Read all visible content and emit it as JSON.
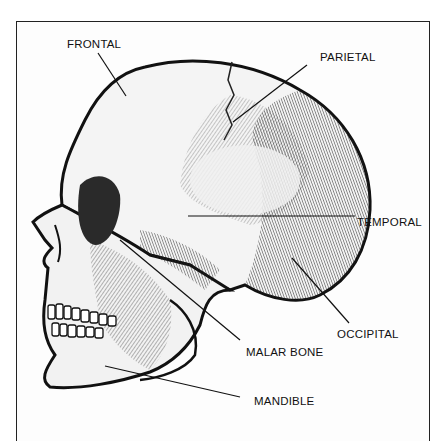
{
  "diagram": {
    "labels": [
      {
        "id": "frontal",
        "text": "FRONTAL",
        "x": 67,
        "y": 38
      },
      {
        "id": "parietal",
        "text": "PARIETAL",
        "x": 320,
        "y": 51
      },
      {
        "id": "temporal",
        "text": "TEMPORAL",
        "x": 357,
        "y": 216
      },
      {
        "id": "occipital",
        "text": "OCCIPITAL",
        "x": 337,
        "y": 328
      },
      {
        "id": "malar",
        "text": "MALAR BONE",
        "x": 246,
        "y": 346
      },
      {
        "id": "mandible",
        "text": "MANDIBLE",
        "x": 254,
        "y": 395
      }
    ],
    "colors": {
      "ink": "#111111",
      "paper": "#fdfdfd",
      "shade": "#3a3a3a"
    }
  }
}
